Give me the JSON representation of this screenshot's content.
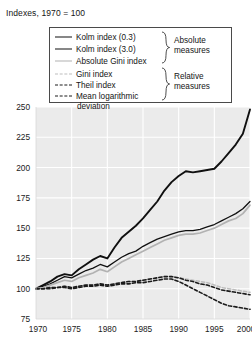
{
  "chart": {
    "title": "Indexes, 1970 = 100"
  },
  "legend": {
    "box_border_color": "#4a4a4a",
    "entries": [
      {
        "label": "Kolm index (0.3)",
        "style": "solid-thick",
        "color": "#101010"
      },
      {
        "label": "Kolm index (3.0)",
        "style": "solid-thin",
        "color": "#101010"
      },
      {
        "label": "Absolute Gini index",
        "style": "solid-gray",
        "color": "#b2b2b2"
      },
      {
        "label": "Gini index",
        "style": "dash-gray",
        "color": "#bdbdbd"
      },
      {
        "label": "Theil index",
        "style": "dash-dark",
        "color": "#1b1b1b"
      },
      {
        "label": "Mean logarithmic",
        "style": "dash-dark",
        "color": "#1b1b1b"
      }
    ],
    "continuation_label": "deviation",
    "groups": [
      {
        "line1": "Absolute",
        "line2": "measures"
      },
      {
        "line1": "Relative",
        "line2": "measures"
      }
    ]
  },
  "chart_data": {
    "type": "line",
    "title": "Indexes, 1970 = 100",
    "xlabel": "",
    "ylabel": "",
    "xlim": [
      1970,
      2000
    ],
    "ylim": [
      75,
      250
    ],
    "xticks": [
      1970,
      1975,
      1980,
      1985,
      1990,
      1995,
      2000
    ],
    "yticks": [
      75,
      100,
      125,
      150,
      175,
      200,
      225,
      250
    ],
    "grid": true,
    "grid_color": "#ffffff",
    "plot_background": "#ebebeb",
    "legend_position": "top-center",
    "x": [
      1970,
      1971,
      1972,
      1973,
      1974,
      1975,
      1976,
      1977,
      1978,
      1979,
      1980,
      1981,
      1982,
      1983,
      1984,
      1985,
      1986,
      1987,
      1988,
      1989,
      1990,
      1991,
      1992,
      1993,
      1994,
      1995,
      1996,
      1997,
      1998,
      1999,
      2000
    ],
    "series": [
      {
        "name": "Kolm index (0.3)",
        "style": "solid",
        "color": "#101010",
        "width": 1.9,
        "values": [
          100,
          103,
          106,
          110,
          112,
          111,
          116,
          120,
          124,
          127,
          125,
          134,
          142,
          147,
          152,
          158,
          165,
          172,
          181,
          188,
          193,
          197,
          196,
          197,
          198,
          199,
          205,
          212,
          219,
          228,
          248
        ]
      },
      {
        "name": "Kolm index (3.0)",
        "style": "solid",
        "color": "#101010",
        "width": 1.3,
        "values": [
          100,
          102,
          104,
          107,
          110,
          109,
          112,
          115,
          117,
          120,
          118,
          122,
          126,
          129,
          131,
          135,
          138,
          141,
          143,
          145,
          147,
          148,
          148,
          149,
          151,
          153,
          156,
          159,
          162,
          166,
          172
        ]
      },
      {
        "name": "Absolute Gini index",
        "style": "solid",
        "color": "#b2b2b2",
        "width": 1.7,
        "values": [
          100,
          101,
          103,
          105,
          107,
          106,
          109,
          111,
          113,
          116,
          114,
          118,
          122,
          125,
          128,
          131,
          134,
          137,
          140,
          142,
          144,
          145,
          145,
          146,
          148,
          150,
          153,
          156,
          158,
          162,
          169
        ]
      },
      {
        "name": "Gini index",
        "style": "dashed",
        "color": "#bdbdbd",
        "width": 1.5,
        "values": [
          100,
          100,
          101,
          101,
          102,
          101,
          102,
          103,
          103,
          104,
          103,
          104,
          105,
          106,
          106,
          107,
          108,
          109,
          110,
          110,
          109,
          108,
          107,
          106,
          105,
          103,
          101,
          100,
          99,
          98,
          97
        ]
      },
      {
        "name": "Theil index",
        "style": "dashed",
        "color": "#1b1b1b",
        "width": 1.6,
        "values": [
          100,
          100,
          101,
          101,
          102,
          101,
          102,
          103,
          103,
          104,
          103,
          104,
          105,
          106,
          106,
          107,
          108,
          109,
          110,
          110,
          109,
          107,
          106,
          104,
          103,
          101,
          99,
          98,
          97,
          96,
          95
        ]
      },
      {
        "name": "Mean logarithmic deviation",
        "style": "dashed",
        "color": "#1b1b1b",
        "width": 1.6,
        "values": [
          100,
          100,
          100,
          101,
          101,
          100,
          101,
          102,
          102,
          103,
          102,
          103,
          104,
          104,
          105,
          105,
          106,
          107,
          108,
          108,
          106,
          103,
          100,
          97,
          94,
          91,
          88,
          86,
          85,
          84,
          83
        ]
      }
    ]
  }
}
